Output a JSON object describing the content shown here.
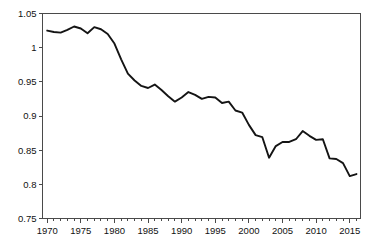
{
  "chart_data": {
    "type": "line",
    "title": "",
    "subtitle": "",
    "xlabel": "",
    "ylabel": "",
    "xlim": [
      1969.3,
      2016.6
    ],
    "ylim": [
      0.75,
      1.05
    ],
    "grid": false,
    "legend": null,
    "legend_position": "none",
    "line_color": "#141414",
    "axis_color": "#4a4a4a",
    "background_color": "#ffffff",
    "y_ticks": [
      "1.05",
      "1",
      "0.95",
      "0.9",
      "0.85",
      "0.8",
      "0.75"
    ],
    "y_tick_values": [
      1.05,
      1.0,
      0.95,
      0.9,
      0.85,
      0.8,
      0.75
    ],
    "x_ticks": [
      "1970",
      "1975",
      "1980",
      "1985",
      "1990",
      "1995",
      "2000",
      "2005",
      "2010",
      "2015"
    ],
    "x_tick_values": [
      1970,
      1975,
      1980,
      1985,
      1990,
      1995,
      2000,
      2005,
      2010,
      2015
    ],
    "x_minor_tick_step": 1,
    "x": [
      1970,
      1971,
      1972,
      1973,
      1974,
      1975,
      1976,
      1977,
      1978,
      1979,
      1980,
      1981,
      1982,
      1983,
      1984,
      1985,
      1986,
      1987,
      1988,
      1989,
      1990,
      1991,
      1992,
      1993,
      1994,
      1995,
      1996,
      1997,
      1998,
      1999,
      2000,
      2001,
      2002,
      2003,
      2004,
      2005,
      2006,
      2007,
      2008,
      2009,
      2010,
      2011,
      2012,
      2013,
      2014,
      2015,
      2016
    ],
    "series": [
      {
        "name": "value",
        "values": [
          1.025,
          1.023,
          1.022,
          1.026,
          1.031,
          1.028,
          1.021,
          1.03,
          1.027,
          1.02,
          1.006,
          0.983,
          0.962,
          0.952,
          0.944,
          0.941,
          0.946,
          0.938,
          0.929,
          0.921,
          0.927,
          0.935,
          0.931,
          0.925,
          0.928,
          0.927,
          0.919,
          0.921,
          0.908,
          0.905,
          0.887,
          0.872,
          0.869,
          0.839,
          0.856,
          0.862,
          0.862,
          0.866,
          0.878,
          0.871,
          0.865,
          0.866,
          0.838,
          0.837,
          0.831,
          0.812,
          0.815
        ]
      }
    ]
  }
}
